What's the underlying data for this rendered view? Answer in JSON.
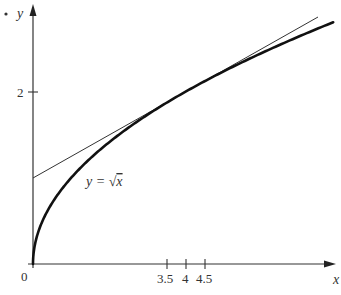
{
  "chart_data": {
    "type": "line",
    "title": "",
    "xlabel": "x",
    "ylabel": "y",
    "origin_label": "0",
    "x_ticks": [
      3.5,
      4,
      4.5
    ],
    "x_tick_labels": [
      "3.5",
      "4",
      "4.5"
    ],
    "y_ticks": [
      2
    ],
    "y_tick_labels": [
      "2"
    ],
    "xlim": [
      0,
      8
    ],
    "ylim": [
      0,
      2.9
    ],
    "grid": false,
    "annotation": "y = √x",
    "series": [
      {
        "name": "y = √x",
        "function": "sqrt(x)",
        "style": "thick",
        "x": [
          0,
          0.25,
          0.5,
          1,
          2,
          3,
          3.5,
          4,
          4.5,
          5,
          6,
          7,
          7.9
        ],
        "y": [
          0,
          0.5,
          0.707,
          1,
          1.414,
          1.732,
          1.871,
          2,
          2.121,
          2.236,
          2.449,
          2.646,
          2.811
        ]
      },
      {
        "name": "tangent at x=4",
        "function": "1 + x/4",
        "style": "thin",
        "x": [
          0,
          7.5
        ],
        "y": [
          1,
          2.875
        ]
      }
    ]
  },
  "labels": {
    "x_axis": "x",
    "y_axis": "y",
    "origin": "0",
    "y_tick_2": "2",
    "x_tick_35": "3.5",
    "x_tick_4": "4",
    "x_tick_45": "4.5",
    "curve_label_prefix": "y = ",
    "curve_label_sqrt": "√",
    "curve_label_var": "x"
  }
}
